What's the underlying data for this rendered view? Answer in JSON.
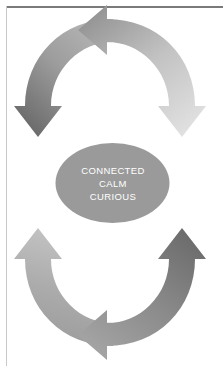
{
  "page": {
    "background_color": "#ffffff",
    "width": 223,
    "height": 366,
    "rule_top_color": "#7a7a7a",
    "rule_left_color": "#c9c9c9"
  },
  "diagram": {
    "name": "dual-cycle-arrow-diagram",
    "type": "cycle",
    "center_label": {
      "shape": "ellipse",
      "fill_color": "#9a9a9a",
      "text_color": "#ffffff",
      "lines": [
        "CONNECTED",
        "CALM",
        "CURIOUS"
      ]
    },
    "cycles": [
      {
        "name": "upper-cycle",
        "arrows": [
          {
            "name": "upper-left-arrow",
            "direction": "up",
            "color_start": "#a8a8a8",
            "color_end": "#6e6e6e"
          },
          {
            "name": "upper-right-arrow",
            "direction": "down",
            "color_start": "#9c9c9c",
            "color_end": "#dcdcdc"
          }
        ]
      },
      {
        "name": "lower-cycle",
        "arrows": [
          {
            "name": "lower-left-arrow",
            "direction": "down",
            "color_start": "#bdbdbd",
            "color_end": "#9e9e9e"
          },
          {
            "name": "lower-right-arrow",
            "direction": "up",
            "color_start": "#9a9a9a",
            "color_end": "#6e6e6e"
          }
        ]
      }
    ]
  }
}
